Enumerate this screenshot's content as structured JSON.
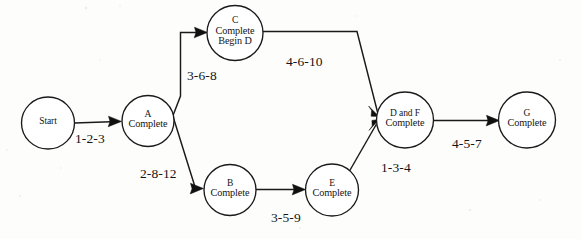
{
  "diagram": {
    "type": "network-diagram",
    "background_color": "#fdfdfb",
    "stroke_color": "#1a1a1a",
    "nodes": [
      {
        "id": "start",
        "lines": [
          "Start"
        ],
        "cx": 48,
        "cy": 123,
        "r": 26
      },
      {
        "id": "a",
        "lines": [
          "A",
          "Complete"
        ],
        "cx": 148,
        "cy": 121,
        "r": 26
      },
      {
        "id": "c",
        "lines": [
          "C",
          "Complete",
          "Begin D"
        ],
        "cx": 235,
        "cy": 33,
        "r": 28
      },
      {
        "id": "b",
        "lines": [
          "B",
          "Complete"
        ],
        "cx": 230,
        "cy": 190,
        "r": 26
      },
      {
        "id": "e",
        "lines": [
          "E",
          "Complete"
        ],
        "cx": 332,
        "cy": 190,
        "r": 26
      },
      {
        "id": "df",
        "lines": [
          "D and F",
          "Complete"
        ],
        "cx": 405,
        "cy": 120,
        "r": 28
      },
      {
        "id": "g",
        "lines": [
          "G",
          "Complete"
        ],
        "cx": 527,
        "cy": 120,
        "r": 28
      }
    ],
    "edges": [
      {
        "id": "start-a",
        "from": "start",
        "to": "a",
        "label": "1-2-3",
        "label_x": 75,
        "label_y": 131
      },
      {
        "id": "a-c",
        "from": "a",
        "to": "c",
        "label": "3-6-8",
        "label_x": 187,
        "label_y": 68
      },
      {
        "id": "a-b",
        "from": "a",
        "to": "b",
        "label": "2-8-12",
        "label_x": 140,
        "label_y": 166
      },
      {
        "id": "c-df",
        "from": "c",
        "to": "df",
        "label": "4-6-10",
        "label_x": 286,
        "label_y": 54
      },
      {
        "id": "b-e",
        "from": "b",
        "to": "e",
        "label": "3-5-9",
        "label_x": 271,
        "label_y": 210
      },
      {
        "id": "e-df",
        "from": "e",
        "to": "df",
        "label": "1-3-4",
        "label_x": 381,
        "label_y": 160
      },
      {
        "id": "df-g",
        "from": "df",
        "to": "g",
        "label": "4-5-7",
        "label_x": 452,
        "label_y": 136
      }
    ]
  }
}
